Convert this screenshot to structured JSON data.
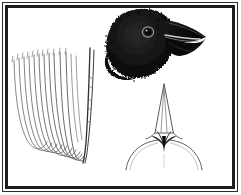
{
  "plate": {
    "title": "Bird anatomical plate",
    "background_color": "#ffffff",
    "ink_color": "#1d1d1d",
    "frame": {
      "name": "double-rule-border",
      "outer_color": "#2b2b2b",
      "inner_color": "#1d1d1d",
      "style": "double line rule"
    },
    "figures": [
      {
        "id": "head",
        "label": "Finch head in left profile",
        "description": "Dark stippled head of a finch with heavy conical black bill and faint pale eye ring",
        "position": "top-right",
        "color": "#111111",
        "details": {
          "eye": "pale ring on dark plumage",
          "bill": "heavy conical, black, with light gape highlight",
          "plumage": "solid black, stippled ragged nape edge"
        }
      },
      {
        "id": "wing",
        "label": "Folded wing primaries",
        "description": "Outline line-drawing of nested primary flight feathers, shafts above and rounded tips below",
        "position": "left",
        "color": "#555555",
        "details": {
          "feather_count": 11,
          "style": "fine contour outlines, no shading"
        }
      },
      {
        "id": "culmen",
        "label": "Bill seen from above",
        "description": "Dorsal view of the bill showing the narrow culmen ridge, dark nostril wedge and the curved forehead outline",
        "position": "bottom-right",
        "color": "#3a3a3a",
        "details": {
          "culmen": "narrow elongated triangle",
          "base": "dark wedge-shaped marking",
          "forehead": "broad downward arc"
        }
      }
    ]
  }
}
